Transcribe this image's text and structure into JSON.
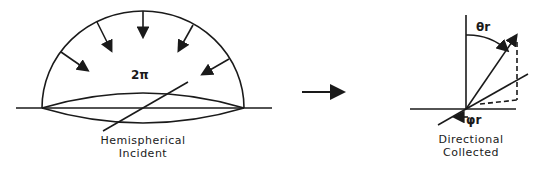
{
  "left_figure": {
    "solid_angle_label": "2π",
    "caption_line1": "Hemispherical",
    "caption_line2": "Incident"
  },
  "right_figure": {
    "theta_label": "θr",
    "phi_label": "φr",
    "caption_line1": "Directional",
    "caption_line2": "Collected"
  },
  "colors": {
    "ink": "#1a1a1a",
    "background": "#ffffff"
  }
}
